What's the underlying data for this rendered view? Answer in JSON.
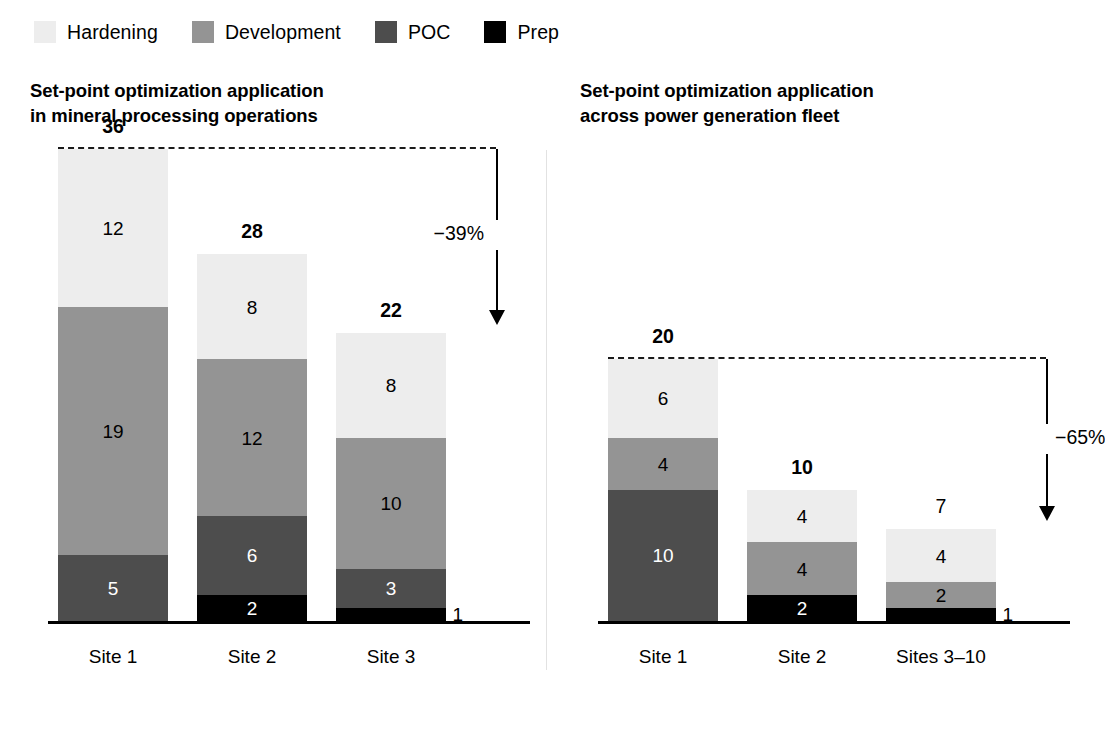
{
  "legend": {
    "items": [
      {
        "label": "Hardening",
        "color": "#ededed",
        "key": "hardening"
      },
      {
        "label": "Development",
        "color": "#949494",
        "key": "development"
      },
      {
        "label": "POC",
        "color": "#4d4d4d",
        "key": "poc"
      },
      {
        "label": "Prep",
        "color": "#000000",
        "key": "prep"
      }
    ]
  },
  "panels": [
    {
      "title": "Set-point optimization application\nin mineral processing operations",
      "delta": {
        "text": "−39%",
        "side": "left"
      },
      "reference_value": 36
    },
    {
      "title": "Set-point optimization application\nacross power generation fleet",
      "delta": {
        "text": "−65%",
        "side": "right"
      },
      "reference_value": 20
    }
  ],
  "chart_data": [
    {
      "type": "bar",
      "stacked": true,
      "title": "Set-point optimization application in mineral processing operations",
      "xlabel": "",
      "ylabel": "",
      "ylim": [
        0,
        36
      ],
      "grid": false,
      "legend_position": "top",
      "categories": [
        "Site 1",
        "Site 2",
        "Site 3"
      ],
      "series": [
        {
          "name": "Hardening",
          "color": "#ededed",
          "values": [
            12,
            8,
            8
          ]
        },
        {
          "name": "Development",
          "color": "#949494",
          "values": [
            19,
            12,
            10
          ]
        },
        {
          "name": "POC",
          "color": "#4d4d4d",
          "values": [
            5,
            6,
            3
          ]
        },
        {
          "name": "Prep",
          "color": "#000000",
          "values": [
            0,
            2,
            1
          ]
        }
      ],
      "totals": [
        36,
        28,
        22
      ],
      "totals_bold": [
        true,
        true,
        true
      ],
      "annotations": [
        {
          "text": "−39%",
          "type": "delta-arrow",
          "from_total": 36,
          "to_total": 22
        }
      ],
      "reference_line": {
        "value": 36,
        "style": "dashed"
      }
    },
    {
      "type": "bar",
      "stacked": true,
      "title": "Set-point optimization application across power generation fleet",
      "xlabel": "",
      "ylabel": "",
      "ylim": [
        0,
        20
      ],
      "grid": false,
      "legend_position": "top",
      "categories": [
        "Site 1",
        "Site 2",
        "Sites 3–10"
      ],
      "series": [
        {
          "name": "Hardening",
          "color": "#ededed",
          "values": [
            6,
            4,
            4
          ]
        },
        {
          "name": "Development",
          "color": "#949494",
          "values": [
            4,
            4,
            2
          ]
        },
        {
          "name": "POC",
          "color": "#4d4d4d",
          "values": [
            10,
            0,
            0
          ]
        },
        {
          "name": "Prep",
          "color": "#000000",
          "values": [
            0,
            2,
            1
          ]
        }
      ],
      "totals": [
        20,
        10,
        7
      ],
      "totals_bold": [
        true,
        true,
        false
      ],
      "annotations": [
        {
          "text": "−65%",
          "type": "delta-arrow",
          "from_total": 20,
          "to_total": 7
        }
      ],
      "reference_line": {
        "value": 20,
        "style": "dashed"
      }
    }
  ]
}
